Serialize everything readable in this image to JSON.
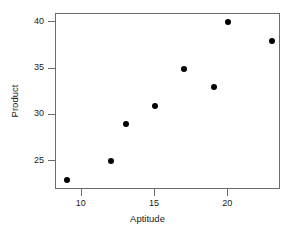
{
  "chart_data": {
    "type": "scatter",
    "title": "",
    "xlabel": "Aptitude",
    "ylabel": "Product",
    "x": [
      9,
      12,
      13,
      15,
      17,
      19,
      20,
      23
    ],
    "y": [
      23,
      25,
      29,
      31,
      35,
      33,
      40,
      38
    ],
    "points": [
      {
        "x": 9,
        "y": 23
      },
      {
        "x": 12,
        "y": 25
      },
      {
        "x": 13,
        "y": 29
      },
      {
        "x": 15,
        "y": 31
      },
      {
        "x": 17,
        "y": 35
      },
      {
        "x": 19,
        "y": 33
      },
      {
        "x": 20,
        "y": 40
      },
      {
        "x": 23,
        "y": 38
      }
    ],
    "xlim": [
      8.25,
      23.6
    ],
    "ylim": [
      21.9,
      40.9
    ],
    "xticks": [
      10,
      15,
      20
    ],
    "yticks": [
      25,
      30,
      35,
      40
    ],
    "xtick_labels": [
      "10",
      "15",
      "20"
    ],
    "ytick_labels": [
      "25",
      "30",
      "35",
      "40"
    ],
    "grid": false,
    "legend": null,
    "marker": "filled-circle",
    "marker_color": "#000000",
    "frame_color": "#6b6b6b",
    "background_color": "#ffffff"
  }
}
